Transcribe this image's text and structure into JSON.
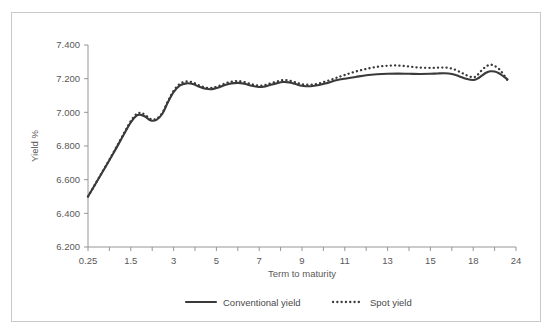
{
  "chart_data": {
    "type": "line",
    "title": "",
    "xlabel": "Term to maturity",
    "ylabel": "Yield %",
    "ylim": [
      6.2,
      7.4
    ],
    "ytick_labels": [
      "6.200",
      "6.400",
      "6.600",
      "6.800",
      "7.000",
      "7.200",
      "7.400"
    ],
    "ytick_values": [
      6.2,
      6.4,
      6.6,
      6.8,
      7.0,
      7.2,
      7.4
    ],
    "xtick_labels": [
      "0.25",
      "1.5",
      "3",
      "5",
      "7",
      "9",
      "11",
      "13",
      "15",
      "18",
      "24"
    ],
    "xtick_values": [
      0.25,
      1.5,
      3,
      5,
      7,
      9,
      11,
      13,
      15,
      18,
      24
    ],
    "grid": false,
    "legend_position": "bottom",
    "axis_color": "#8a8a8a",
    "series_color": "#3a3a3a",
    "series": [
      {
        "name": "Conventional yield",
        "style": "solid",
        "x": [
          0.25,
          0.6,
          1.0,
          1.3,
          1.5,
          1.7,
          1.85,
          2.0,
          2.2,
          2.4,
          2.6,
          2.8,
          3.0,
          3.3,
          3.6,
          3.9,
          4.2,
          4.5,
          4.8,
          5.1,
          5.4,
          5.7,
          6.0,
          6.3,
          6.6,
          6.9,
          7.2,
          7.5,
          7.8,
          8.1,
          8.4,
          8.7,
          9.0,
          9.4,
          9.8,
          10.2,
          10.6,
          11.0,
          11.5,
          12.0,
          12.5,
          13.0,
          13.5,
          14.0,
          14.5,
          15.0,
          15.5,
          16.0,
          16.5,
          17.0,
          17.5,
          18.0,
          18.6,
          19.2,
          19.8,
          20.4,
          21.0,
          21.6,
          22.2,
          22.8
        ],
        "y": [
          6.5,
          6.62,
          6.76,
          6.87,
          6.94,
          6.98,
          6.985,
          6.975,
          6.952,
          6.955,
          6.99,
          7.06,
          7.12,
          7.16,
          7.172,
          7.168,
          7.152,
          7.14,
          7.138,
          7.148,
          7.162,
          7.172,
          7.175,
          7.17,
          7.16,
          7.152,
          7.152,
          7.162,
          7.172,
          7.18,
          7.178,
          7.168,
          7.158,
          7.155,
          7.162,
          7.175,
          7.19,
          7.2,
          7.21,
          7.22,
          7.226,
          7.229,
          7.23,
          7.229,
          7.228,
          7.229,
          7.231,
          7.232,
          7.228,
          7.215,
          7.2,
          7.192,
          7.2,
          7.218,
          7.235,
          7.244,
          7.242,
          7.232,
          7.215,
          7.196
        ]
      },
      {
        "name": "Spot yield",
        "style": "dotted",
        "x": [
          0.25,
          0.6,
          1.0,
          1.3,
          1.5,
          1.7,
          1.85,
          2.0,
          2.2,
          2.4,
          2.6,
          2.8,
          3.0,
          3.3,
          3.6,
          3.9,
          4.2,
          4.5,
          4.8,
          5.1,
          5.4,
          5.7,
          6.0,
          6.3,
          6.6,
          6.9,
          7.2,
          7.5,
          7.8,
          8.1,
          8.4,
          8.7,
          9.0,
          9.4,
          9.8,
          10.2,
          10.6,
          11.0,
          11.5,
          12.0,
          12.5,
          13.0,
          13.5,
          14.0,
          14.5,
          15.0,
          15.5,
          16.0,
          16.5,
          17.0,
          17.5,
          18.0,
          18.6,
          19.2,
          19.8,
          20.4,
          21.0,
          21.6,
          22.2,
          22.8
        ],
        "y": [
          6.5,
          6.622,
          6.764,
          6.876,
          6.948,
          6.99,
          6.996,
          6.986,
          6.96,
          6.962,
          6.996,
          7.066,
          7.128,
          7.17,
          7.183,
          7.178,
          7.16,
          7.147,
          7.145,
          7.156,
          7.171,
          7.182,
          7.186,
          7.18,
          7.169,
          7.16,
          7.16,
          7.171,
          7.182,
          7.191,
          7.189,
          7.178,
          7.167,
          7.164,
          7.172,
          7.187,
          7.205,
          7.222,
          7.242,
          7.258,
          7.27,
          7.277,
          7.278,
          7.272,
          7.266,
          7.264,
          7.265,
          7.266,
          7.26,
          7.243,
          7.222,
          7.208,
          7.222,
          7.25,
          7.272,
          7.283,
          7.276,
          7.258,
          7.228,
          7.19
        ]
      }
    ],
    "legend": [
      {
        "label": "Conventional yield",
        "style": "solid"
      },
      {
        "label": "Spot yield",
        "style": "dotted"
      }
    ]
  }
}
